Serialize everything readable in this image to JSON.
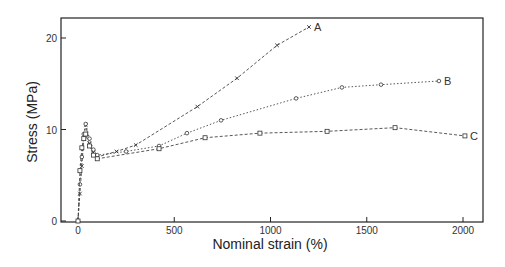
{
  "chart_data": {
    "type": "line",
    "title": "",
    "xlabel": "Nominal strain (%)",
    "ylabel": "Stress (MPa)",
    "xlim": [
      -90,
      2110
    ],
    "ylim": [
      0,
      22
    ],
    "xticks": [
      0,
      500,
      1000,
      1500,
      2000
    ],
    "yticks": [
      0,
      10,
      20
    ],
    "grid": false,
    "legend": "inline labels at line ends",
    "series": [
      {
        "name": "A",
        "marker": "x",
        "style": "dashed",
        "x": [
          0,
          10,
          20,
          30,
          40,
          60,
          80,
          100,
          200,
          300,
          620,
          826,
          1034,
          1200
        ],
        "y": [
          0,
          3,
          6,
          9,
          10.5,
          8.5,
          7.5,
          7.0,
          7.6,
          8.3,
          12.5,
          15.6,
          19.2,
          21.2
        ]
      },
      {
        "name": "B",
        "marker": "o",
        "style": "dotted",
        "x": [
          0,
          10,
          20,
          30,
          40,
          60,
          80,
          100,
          250,
          421,
          566,
          743,
          1133,
          1371,
          1574,
          1875
        ],
        "y": [
          0,
          4,
          7,
          9.5,
          10.6,
          9.0,
          7.8,
          7.2,
          7.6,
          8.2,
          9.6,
          11.0,
          13.4,
          14.6,
          14.9,
          15.3
        ]
      },
      {
        "name": "C",
        "marker": "square",
        "style": "dashed",
        "x": [
          0,
          10,
          20,
          30,
          40,
          60,
          80,
          100,
          421,
          660,
          945,
          1294,
          1647,
          2010
        ],
        "y": [
          0,
          5.5,
          8.0,
          9.0,
          9.5,
          8.2,
          7.2,
          6.8,
          7.9,
          9.1,
          9.6,
          9.8,
          10.2,
          9.3
        ]
      }
    ]
  }
}
